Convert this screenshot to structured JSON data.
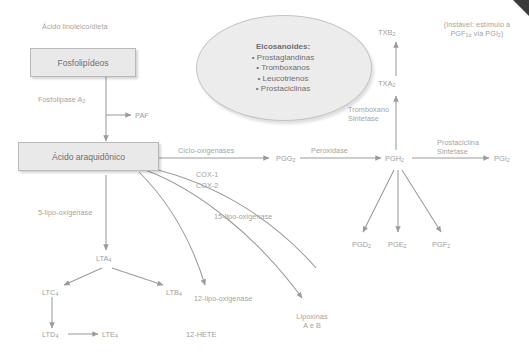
{
  "diagram": {
    "boxes": [
      {
        "id": "phospholipids",
        "label": "Fosfolipídeos"
      },
      {
        "id": "arachidonic",
        "label": "Ácido araquidônico"
      }
    ],
    "ellipse": {
      "title": "Eicosanoides:",
      "items": [
        "• Prostaglandinas",
        "• Tromboxanos",
        "• Leucotrienos",
        "• Prostaciclinas"
      ]
    },
    "source_label": "Ácido linoleico/dieta",
    "enzymes": {
      "phospholipase": "Fosfolipase A",
      "phospholipase_sub": "2",
      "cyclooxygenases": "Ciclo-oxigenases",
      "cox1": "COX-1",
      "cox2": "COX-2",
      "peroxidase": "Peroxidase",
      "thromboxane_synthase_l1": "Tromboxano",
      "thromboxane_synthase_l2": "Sintetase",
      "prostacyclin_synthase_l1": "Prostaciclina",
      "prostacyclin_synthase_l2": "Sintetase",
      "lipox5": "5-lipo-oxigenase",
      "lipox15": "15-lipo-oxigenase",
      "lipox12": "12-lipo-oxigenase"
    },
    "metabolites": {
      "paf": "PAF",
      "pgg2": "PGG",
      "pgg2_sub": "2",
      "pgh2": "PGH",
      "pgh2_sub": "2",
      "pgi2": "PGI",
      "pgi2_sub": "2",
      "txa2": "TXA",
      "txa2_sub": "2",
      "txb2": "TXB",
      "txb2_sub": "2",
      "pgd2": "PGD",
      "pgd2_sub": "2",
      "pge2": "PGE",
      "pge2_sub": "2",
      "pgf2": "PGF",
      "pgf2_sub": "2",
      "lta4": "LTA",
      "lta4_sub": "4",
      "ltb4": "LTB",
      "ltb4_sub": "4",
      "ltc4": "LTC",
      "ltc4_sub": "4",
      "ltd4": "LTD",
      "ltd4_sub": "4",
      "lte4": "LTE",
      "lte4_sub": "4",
      "hete12": "12-HETE",
      "lipoxins_l1": "Lipoxinas",
      "lipoxins_l2": "A e B"
    },
    "annotation": {
      "line1": "(Instável: estímulo a",
      "line2": "PGF",
      "line2_sub": "1α",
      "line2_tail": " via PGI",
      "line2_sub2": "2",
      "line2_end": ")"
    },
    "colors": {
      "arrow": "#9b9b9b",
      "box_fill": "#e9e9e9",
      "box_border": "#b9b9b9",
      "text": "#9e9e9e",
      "heading_text": "#6f6f6f"
    }
  }
}
